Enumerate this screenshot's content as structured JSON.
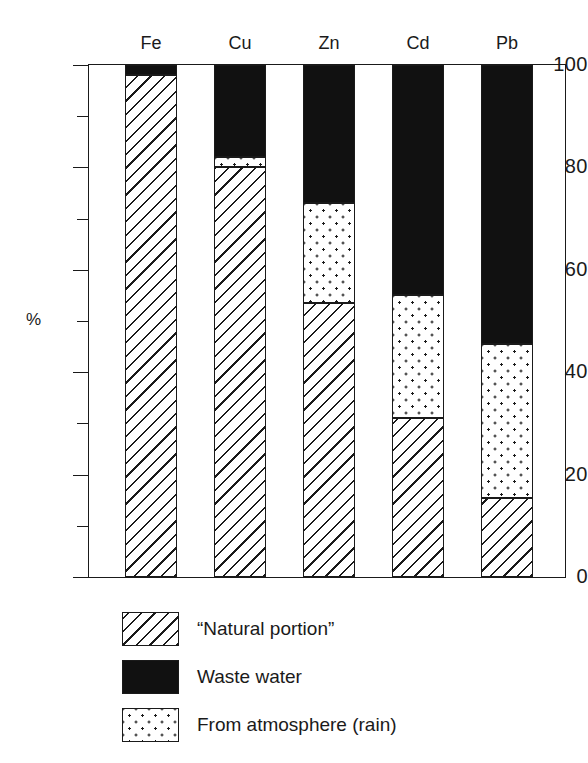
{
  "chart_data": {
    "type": "bar",
    "subtype": "stacked-bar-100-percent",
    "title": "",
    "xlabel": "",
    "ylabel": "%",
    "ylim": [
      0,
      100
    ],
    "ytick_major": [
      0,
      20,
      40,
      60,
      80,
      100
    ],
    "ytick_major_labels": [
      "0",
      "20",
      "40",
      "60",
      "80",
      "100"
    ],
    "ytick_minor": [
      10,
      30,
      50,
      70,
      90
    ],
    "grid": false,
    "legend_position": "below-plot-left",
    "categories": [
      "Fe",
      "Cu",
      "Zn",
      "Cd",
      "Pb"
    ],
    "series": [
      {
        "name": "“Natural portion”",
        "pattern": "diagonal-hatch",
        "values": [
          98,
          80,
          53.5,
          31,
          15.5
        ]
      },
      {
        "name": "From atmosphere (rain)",
        "pattern": "dots",
        "values": [
          0,
          2,
          19.5,
          24,
          30
        ]
      },
      {
        "name": "Waste water",
        "pattern": "solid-black",
        "values": [
          2,
          18,
          27,
          45,
          54.5
        ]
      }
    ],
    "stack_order_bottom_to_top": [
      "“Natural portion”",
      "From atmosphere (rain)",
      "Waste water"
    ],
    "cumulative_boundaries": {
      "Fe": [
        0,
        98,
        98,
        100
      ],
      "Cu": [
        0,
        80,
        82,
        100
      ],
      "Zn": [
        0,
        53.5,
        73,
        100
      ],
      "Cd": [
        0,
        31,
        55,
        100
      ],
      "Pb": [
        0,
        15.5,
        45.5,
        100
      ]
    }
  },
  "legend": {
    "items": [
      {
        "label": "“Natural portion”",
        "pattern": "diagonal-hatch"
      },
      {
        "label": "Waste water",
        "pattern": "solid-black"
      },
      {
        "label": "From atmosphere (rain)",
        "pattern": "dots"
      }
    ]
  },
  "colors": {
    "ink": "#1a1a1a",
    "solid_fill": "#111111",
    "background": "#ffffff"
  }
}
